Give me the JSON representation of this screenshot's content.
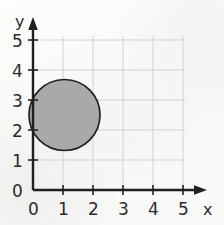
{
  "figure": {
    "kind": "coordinate-grid-with-shaded-circle",
    "background_color": "#fbfbfa",
    "grid_color": "#d3d3d5",
    "axis_color": "#231f20",
    "label_color": "#2b2b2b"
  },
  "axes": {
    "x": {
      "name": "x",
      "ticks": [
        "0",
        "1",
        "2",
        "3",
        "4",
        "5"
      ],
      "min": 0,
      "max": 5,
      "arrow": true,
      "arrow_icon": "axis-arrow-right"
    },
    "y": {
      "name": "y",
      "ticks": [
        "0",
        "1",
        "2",
        "3",
        "4",
        "5"
      ],
      "min": 0,
      "max": 5,
      "arrow": true,
      "arrow_icon": "axis-arrow-up"
    }
  },
  "shapes": [
    {
      "id": "shaded-circle",
      "type": "circle",
      "center_x": 1.05,
      "center_y": 2.5,
      "radius": 1.2,
      "fill_color": "#a9a9a9",
      "fill_opacity": 1,
      "stroke_color": "#231f20",
      "stroke_width": 1.6
    }
  ],
  "geometry": {
    "origin_px_x": 33,
    "origin_px_y": 190,
    "unit_px": 30,
    "grid_right_px": 185,
    "grid_top_px": 36
  }
}
